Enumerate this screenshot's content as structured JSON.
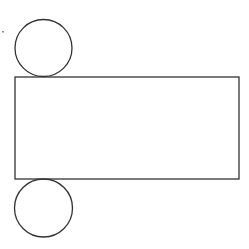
{
  "diagram": {
    "stroke_color": "#333333",
    "background": "#ffffff",
    "shapes": {
      "top_circle": {
        "cx": 43.5,
        "cy": 48,
        "r": 28.5
      },
      "rectangle": {
        "x": 15,
        "y": 77,
        "width": 224,
        "height": 102
      },
      "bottom_circle": {
        "cx": 43.5,
        "cy": 208,
        "r": 29
      },
      "mark": {
        "x": 2,
        "y": 31
      }
    }
  }
}
